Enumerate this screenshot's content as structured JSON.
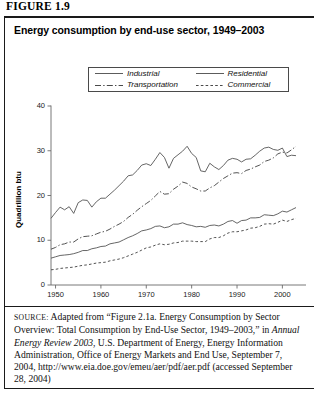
{
  "figure": {
    "label": "FIGURE 1.9"
  },
  "chart_title": "Energy consumption by end-use sector, 1949–2003",
  "legend": {
    "items": [
      {
        "label": "Industrial",
        "style": "solid",
        "key": "industrial"
      },
      {
        "label": "Residential",
        "style": "solid",
        "key": "residential"
      },
      {
        "label": "Transportation",
        "style": "dashdot",
        "key": "transportation"
      },
      {
        "label": "Commercial",
        "style": "dashed",
        "key": "commercial"
      }
    ]
  },
  "source": {
    "prefix": "SOURCE:",
    "line1": " Adapted from “Figure 2.1a. Energy Consumption by Sector Overview: Total Consumption by End-Use Sector, 1949–2003,” in ",
    "italic": "Annual Energy Review 2003",
    "line2": ", U.S. Department of Energy, Energy Information Administration, Office of Energy Markets and End Use, September 7, 2004, http://www.eia.doe.gov/emeu/aer/pdf/aer.pdf (accessed September 28, 2004)"
  },
  "colors": {
    "line": "#4a4a4a",
    "axis": "#6a6a6a",
    "text": "#111111",
    "rule": "#1a1a1a"
  },
  "chart_data": {
    "type": "line",
    "title": "Energy consumption by end-use sector, 1949–2003",
    "xlabel": "",
    "ylabel": "Quadrillion btu",
    "xlim": [
      1949,
      2003
    ],
    "ylim": [
      0,
      40
    ],
    "yticks": [
      0,
      10,
      20,
      30,
      40
    ],
    "xticks": [
      1950,
      1960,
      1970,
      1980,
      1990,
      2000
    ],
    "grid": false,
    "legend_position": "top-center",
    "x": [
      1949,
      1950,
      1951,
      1952,
      1953,
      1954,
      1955,
      1956,
      1957,
      1958,
      1959,
      1960,
      1961,
      1962,
      1963,
      1964,
      1965,
      1966,
      1967,
      1968,
      1969,
      1970,
      1971,
      1972,
      1973,
      1974,
      1975,
      1976,
      1977,
      1978,
      1979,
      1980,
      1981,
      1982,
      1983,
      1984,
      1985,
      1986,
      1987,
      1988,
      1989,
      1990,
      1991,
      1992,
      1993,
      1994,
      1995,
      1996,
      1997,
      1998,
      1999,
      2000,
      2001,
      2002,
      2003
    ],
    "series": [
      {
        "name": "Industrial",
        "style": "solid",
        "values": [
          14.9,
          16.2,
          17.4,
          16.8,
          17.5,
          16.0,
          18.4,
          19.0,
          18.9,
          17.4,
          18.6,
          19.4,
          19.4,
          20.3,
          21.2,
          22.2,
          23.2,
          24.4,
          24.6,
          25.6,
          26.8,
          27.1,
          26.7,
          28.1,
          29.6,
          28.5,
          26.1,
          28.3,
          29.1,
          29.9,
          31.0,
          29.4,
          28.5,
          25.5,
          25.3,
          27.2,
          26.4,
          25.8,
          26.7,
          27.9,
          28.3,
          28.1,
          27.5,
          28.1,
          28.2,
          29.0,
          29.9,
          30.6,
          30.8,
          30.3,
          30.1,
          30.6,
          28.7,
          29.0,
          28.9
        ]
      },
      {
        "name": "Transportation",
        "style": "dashdot",
        "values": [
          8.0,
          8.4,
          9.0,
          9.2,
          9.6,
          9.6,
          10.3,
          10.8,
          10.9,
          11.0,
          11.4,
          11.8,
          12.0,
          12.5,
          13.1,
          13.6,
          14.2,
          15.1,
          15.8,
          16.7,
          17.5,
          18.2,
          18.9,
          19.9,
          20.9,
          20.3,
          20.4,
          21.4,
          22.1,
          23.0,
          22.7,
          21.9,
          21.5,
          21.0,
          21.0,
          21.7,
          22.2,
          23.0,
          23.8,
          24.4,
          25.0,
          25.1,
          24.9,
          25.6,
          25.9,
          26.4,
          26.8,
          27.6,
          27.9,
          28.4,
          29.3,
          29.7,
          29.5,
          30.2,
          31.0
        ]
      },
      {
        "name": "Residential",
        "style": "solid",
        "values": [
          6.0,
          6.3,
          6.6,
          6.7,
          6.8,
          7.0,
          7.3,
          7.7,
          7.7,
          8.1,
          8.3,
          8.6,
          8.7,
          9.2,
          9.4,
          9.6,
          10.1,
          10.6,
          11.0,
          11.5,
          12.1,
          12.3,
          12.6,
          13.1,
          13.2,
          12.8,
          13.0,
          13.6,
          13.6,
          13.9,
          13.5,
          13.3,
          13.0,
          13.1,
          12.9,
          13.3,
          13.4,
          13.2,
          13.6,
          14.2,
          14.4,
          13.8,
          14.4,
          14.5,
          15.0,
          15.0,
          15.1,
          15.7,
          15.6,
          15.5,
          15.9,
          16.5,
          16.3,
          16.8,
          17.3
        ]
      },
      {
        "name": "Commercial",
        "style": "dashed",
        "values": [
          3.4,
          3.5,
          3.7,
          3.8,
          3.9,
          4.0,
          4.2,
          4.4,
          4.5,
          4.7,
          4.9,
          5.0,
          5.1,
          5.4,
          5.6,
          5.8,
          6.1,
          6.5,
          6.9,
          7.3,
          7.8,
          8.3,
          8.5,
          8.9,
          9.2,
          9.0,
          9.1,
          9.4,
          9.5,
          9.8,
          9.8,
          9.8,
          9.7,
          9.7,
          9.7,
          10.3,
          10.6,
          10.6,
          11.0,
          11.6,
          11.9,
          11.9,
          12.1,
          12.3,
          12.7,
          12.8,
          13.1,
          13.6,
          13.7,
          13.6,
          14.0,
          14.5,
          14.2,
          14.6,
          14.9
        ]
      }
    ]
  }
}
